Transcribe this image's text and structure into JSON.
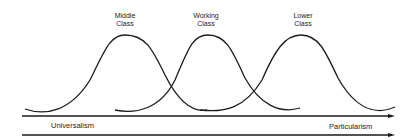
{
  "diagram": {
    "curves": [
      {
        "label_line1": "Middle",
        "label_line2": "Class"
      },
      {
        "label_line1": "Working",
        "label_line2": "Class"
      },
      {
        "label_line1": "Lower",
        "label_line2": "Class"
      }
    ],
    "axis": {
      "left_label": "Universalism",
      "right_label": "Particularism"
    },
    "colors": {
      "stroke": "#1a1a1a",
      "background": "#ffffff"
    }
  }
}
